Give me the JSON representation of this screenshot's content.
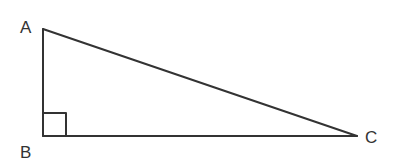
{
  "diagram": {
    "type": "right-triangle",
    "stroke_color": "#333333",
    "background_color": "#ffffff",
    "vertices": {
      "A": {
        "label": "A",
        "x": 43,
        "y": 29
      },
      "B": {
        "label": "B",
        "x": 43,
        "y": 136
      },
      "C": {
        "label": "C",
        "x": 357,
        "y": 136
      }
    },
    "right_angle_at": "B",
    "right_angle_marker_size": 23,
    "edges": [
      {
        "from": "A",
        "to": "B",
        "name": "AB"
      },
      {
        "from": "B",
        "to": "C",
        "name": "BC"
      },
      {
        "from": "A",
        "to": "C",
        "name": "AC"
      }
    ]
  }
}
